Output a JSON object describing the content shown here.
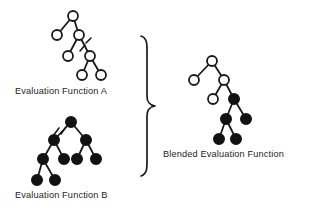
{
  "figure": {
    "background_color": "#ffffff",
    "stroke_color": "#1a1a1a",
    "node_open_fill": "#ffffff",
    "node_filled_fill": "#121212"
  },
  "labels": {
    "tree_a": "Evaluation Function A",
    "tree_b": "Evaluation Function B",
    "blended": "Blended Evaluation Function"
  },
  "diagram_data": {
    "type": "diagram",
    "node_radius": 5.0,
    "trees": [
      {
        "id": "tree-a",
        "label": "Evaluation Function A",
        "node_style": "open",
        "nodes": [
          {
            "id": "a0",
            "x": 73,
            "y": 16,
            "style": "open"
          },
          {
            "id": "a1",
            "x": 57,
            "y": 35,
            "style": "open"
          },
          {
            "id": "a2",
            "x": 79,
            "y": 35,
            "style": "open"
          },
          {
            "id": "a3",
            "x": 68,
            "y": 56,
            "style": "open"
          },
          {
            "id": "a4",
            "x": 90,
            "y": 56,
            "style": "open"
          },
          {
            "id": "a5",
            "x": 82,
            "y": 75,
            "style": "open"
          },
          {
            "id": "a6",
            "x": 101,
            "y": 75,
            "style": "open"
          }
        ],
        "edges": [
          {
            "from": "a0",
            "to": "a1"
          },
          {
            "from": "a0",
            "to": "a2"
          },
          {
            "from": "a2",
            "to": "a3"
          },
          {
            "from": "a2",
            "to": "a4"
          },
          {
            "from": "a4",
            "to": "a5"
          },
          {
            "from": "a4",
            "to": "a6"
          }
        ],
        "cut_mark": {
          "on_edge": "a2-a4",
          "x1": 79,
          "y1": 50,
          "x2": 89,
          "y2": 39
        }
      },
      {
        "id": "tree-b",
        "label": "Evaluation Function B",
        "node_style": "filled",
        "nodes": [
          {
            "id": "b0",
            "x": 71,
            "y": 122,
            "style": "filled"
          },
          {
            "id": "b1",
            "x": 54,
            "y": 140,
            "style": "filled"
          },
          {
            "id": "b2",
            "x": 86,
            "y": 140,
            "style": "filled"
          },
          {
            "id": "b3",
            "x": 43,
            "y": 159,
            "style": "filled"
          },
          {
            "id": "b4",
            "x": 64,
            "y": 159,
            "style": "filled"
          },
          {
            "id": "b5",
            "x": 77,
            "y": 159,
            "style": "filled"
          },
          {
            "id": "b6",
            "x": 96,
            "y": 159,
            "style": "filled"
          },
          {
            "id": "b7",
            "x": 37,
            "y": 180,
            "style": "filled"
          },
          {
            "id": "b8",
            "x": 55,
            "y": 180,
            "style": "filled"
          }
        ],
        "edges": [
          {
            "from": "b0",
            "to": "b1"
          },
          {
            "from": "b0",
            "to": "b2"
          },
          {
            "from": "b1",
            "to": "b3"
          },
          {
            "from": "b1",
            "to": "b4"
          },
          {
            "from": "b2",
            "to": "b5"
          },
          {
            "from": "b2",
            "to": "b6"
          },
          {
            "from": "b3",
            "to": "b7"
          },
          {
            "from": "b3",
            "to": "b8"
          }
        ],
        "cut_mark": {
          "on_edge": "b0-b1",
          "x1": 54,
          "y1": 135,
          "x2": 69,
          "y2": 124
        }
      },
      {
        "id": "tree-blended",
        "label": "Blended Evaluation Function",
        "node_style": "mixed",
        "nodes": [
          {
            "id": "c0",
            "x": 212,
            "y": 61,
            "style": "open"
          },
          {
            "id": "c1",
            "x": 194,
            "y": 80,
            "style": "open"
          },
          {
            "id": "c2",
            "x": 224,
            "y": 80,
            "style": "open"
          },
          {
            "id": "c3",
            "x": 213,
            "y": 99,
            "style": "open"
          },
          {
            "id": "c4",
            "x": 234,
            "y": 99,
            "style": "filled"
          },
          {
            "id": "c5",
            "x": 226,
            "y": 119,
            "style": "filled"
          },
          {
            "id": "c6",
            "x": 246,
            "y": 119,
            "style": "filled"
          },
          {
            "id": "c7",
            "x": 219,
            "y": 139,
            "style": "filled"
          },
          {
            "id": "c8",
            "x": 236,
            "y": 139,
            "style": "filled"
          }
        ],
        "edges": [
          {
            "from": "c0",
            "to": "c1"
          },
          {
            "from": "c0",
            "to": "c2"
          },
          {
            "from": "c2",
            "to": "c3"
          },
          {
            "from": "c2",
            "to": "c4"
          },
          {
            "from": "c4",
            "to": "c5"
          },
          {
            "from": "c4",
            "to": "c6"
          },
          {
            "from": "c5",
            "to": "c7"
          },
          {
            "from": "c5",
            "to": "c8"
          }
        ],
        "cut_mark": null
      }
    ],
    "brace": {
      "orientation": "right-pointing",
      "top_y": 36,
      "bottom_y": 176,
      "tip_y": 106,
      "left_x": 141,
      "tip_x": 155
    }
  }
}
